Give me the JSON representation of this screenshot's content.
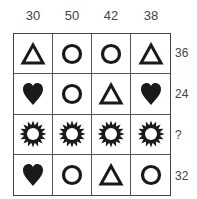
{
  "columns": [
    "30",
    "50",
    "42",
    "38"
  ],
  "rows": [
    {
      "sum": "36",
      "shapes": [
        "triangle",
        "circle",
        "circle",
        "triangle"
      ]
    },
    {
      "sum": "24",
      "shapes": [
        "heart",
        "circle",
        "triangle",
        "heart"
      ]
    },
    {
      "sum": "?",
      "shapes": [
        "sun",
        "sun",
        "sun",
        "sun"
      ]
    },
    {
      "sum": "32",
      "shapes": [
        "heart",
        "circle",
        "triangle",
        "circle"
      ]
    }
  ],
  "colors": {
    "ink": "#1a1a1a",
    "grid": "#444444"
  }
}
